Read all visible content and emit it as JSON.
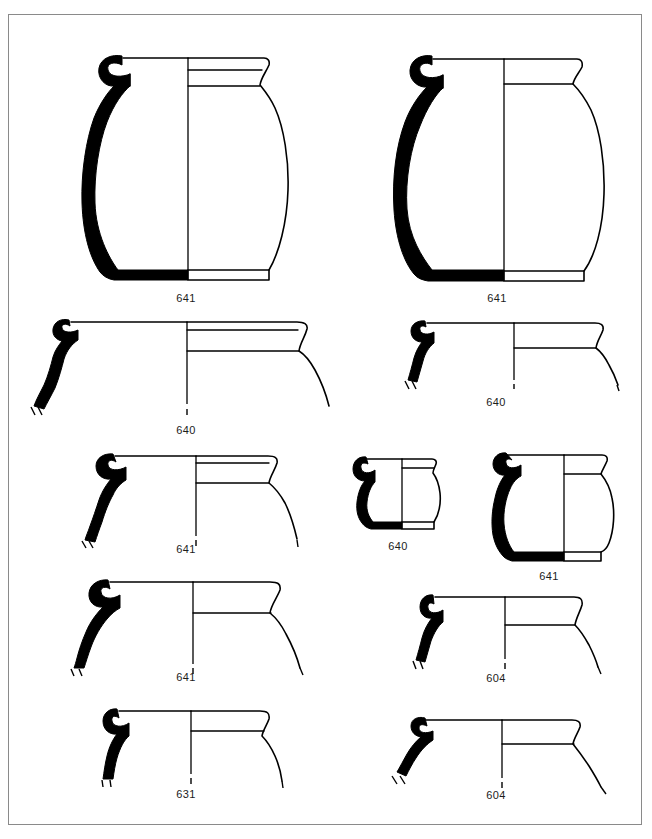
{
  "plate": {
    "kind": "archaeological-pottery-profile-plate",
    "background_color": "#ffffff",
    "ink_color": "#000000",
    "border_color": "#8a8a8a",
    "width": 652,
    "height": 839,
    "figure_count": 11
  },
  "figures": [
    {
      "id": "fig-1",
      "catalogue_number": "641",
      "row": 1,
      "column": "left",
      "form": "large-jar-complete-profile",
      "caption_x": 186,
      "caption_y": 292
    },
    {
      "id": "fig-2",
      "catalogue_number": "641",
      "row": 1,
      "column": "right",
      "form": "large-jar-complete-profile",
      "caption_x": 497,
      "caption_y": 292
    },
    {
      "id": "fig-3",
      "catalogue_number": "640",
      "row": 2,
      "column": "left",
      "form": "wide-rim-sherd",
      "caption_x": 186,
      "caption_y": 424
    },
    {
      "id": "fig-4",
      "catalogue_number": "640",
      "row": 2,
      "column": "right",
      "form": "wide-rim-sherd",
      "caption_x": 496,
      "caption_y": 396
    },
    {
      "id": "fig-5",
      "catalogue_number": "641",
      "row": 3,
      "column": "left",
      "form": "everted-rim-sherd",
      "caption_x": 186,
      "caption_y": 543
    },
    {
      "id": "fig-6",
      "catalogue_number": "640",
      "row": 3,
      "column": "center",
      "form": "small-jar-complete-profile",
      "caption_x": 398,
      "caption_y": 540
    },
    {
      "id": "fig-7",
      "catalogue_number": "641",
      "row": 3,
      "column": "right",
      "form": "jar-complete-profile",
      "caption_x": 549,
      "caption_y": 570
    },
    {
      "id": "fig-8",
      "catalogue_number": "641",
      "row": 4,
      "column": "left",
      "form": "everted-rim-sherd",
      "caption_x": 186,
      "caption_y": 671
    },
    {
      "id": "fig-9",
      "catalogue_number": "604",
      "row": 4,
      "column": "right",
      "form": "everted-rim-sherd",
      "caption_x": 496,
      "caption_y": 672
    },
    {
      "id": "fig-10",
      "catalogue_number": "631",
      "row": 5,
      "column": "left",
      "form": "everted-rim-sherd",
      "caption_x": 186,
      "caption_y": 788
    },
    {
      "id": "fig-11",
      "catalogue_number": "604",
      "row": 5,
      "column": "right",
      "form": "flaring-rim-sherd",
      "caption_x": 496,
      "caption_y": 789
    }
  ]
}
